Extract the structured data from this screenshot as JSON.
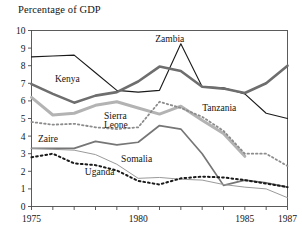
{
  "chart_data": {
    "type": "line",
    "title": "Percentage of GDP",
    "xlabel": "",
    "ylabel": "",
    "xlim": [
      1975,
      1987
    ],
    "ylim": [
      0,
      10
    ],
    "grid": false,
    "legend_position": "inline-annotations",
    "x_ticks": [
      1975,
      1976,
      1977,
      1978,
      1979,
      1980,
      1981,
      1982,
      1983,
      1984,
      1985,
      1986,
      1987
    ],
    "x_tick_labels": [
      "1975",
      "",
      "",
      "",
      "",
      "1980",
      "",
      "",
      "",
      "",
      "1985",
      "",
      "1987"
    ],
    "y_ticks": [
      0,
      1,
      2,
      3,
      4,
      5,
      6,
      7,
      8,
      9,
      10
    ],
    "y_tick_labels": [
      "0",
      "1",
      "2",
      "3",
      "4",
      "5",
      "6",
      "7",
      "8",
      "9",
      "10"
    ],
    "x": [
      1975,
      1976,
      1977,
      1978,
      1979,
      1980,
      1981,
      1982,
      1983,
      1984,
      1985,
      1986,
      1987
    ],
    "series": [
      {
        "name": "Zambia",
        "color": "#1a1a1a",
        "width": 1.1,
        "dash": "solid",
        "values": [
          8.5,
          8.55,
          8.6,
          7.6,
          6.6,
          6.5,
          6.6,
          9.25,
          6.8,
          6.75,
          6.4,
          5.3,
          5.0
        ]
      },
      {
        "name": "Kenya",
        "color": "#6e6e6e",
        "width": 2.6,
        "dash": "solid",
        "values": [
          6.95,
          6.4,
          5.9,
          6.3,
          6.5,
          7.1,
          7.95,
          7.7,
          6.8,
          6.7,
          6.45,
          7.0,
          8.0
        ]
      },
      {
        "name": "Tanzania",
        "color": "#b3b3b3",
        "width": 3.0,
        "dash": "solid",
        "values": [
          6.2,
          5.2,
          5.3,
          5.75,
          5.95,
          5.6,
          5.25,
          5.7,
          4.9,
          4.15,
          2.85,
          null,
          null
        ]
      },
      {
        "name": "Sierra Leone",
        "color": "#8c8c8c",
        "width": 1.8,
        "dash": "dotted",
        "values": [
          4.8,
          4.65,
          4.7,
          4.5,
          4.4,
          4.5,
          5.95,
          5.6,
          5.1,
          4.3,
          3.0,
          3.0,
          2.3
        ]
      },
      {
        "name": "Zaire",
        "color": "#767676",
        "width": 1.7,
        "dash": "solid",
        "values": [
          3.3,
          3.3,
          3.3,
          3.7,
          3.5,
          3.65,
          4.6,
          4.4,
          3.0,
          1.2,
          1.5,
          1.35,
          1.1
        ]
      },
      {
        "name": "Somalia",
        "color": "#9a9a9a",
        "width": 1.0,
        "dash": "solid",
        "values": [
          3.3,
          3.25,
          3.2,
          2.95,
          2.4,
          1.6,
          1.65,
          1.55,
          1.5,
          1.25,
          1.1,
          1.0,
          0.5
        ]
      },
      {
        "name": "Uganda",
        "color": "#1a1a1a",
        "width": 2.0,
        "dash": "dotted",
        "values": [
          2.8,
          3.0,
          2.45,
          2.35,
          2.05,
          1.45,
          1.25,
          1.6,
          1.7,
          1.65,
          1.5,
          1.3,
          1.1
        ]
      }
    ],
    "annotations": [
      {
        "text": "Kenya",
        "x": 1976.1,
        "y": 7.05
      },
      {
        "text": "Zambia",
        "x": 1980.8,
        "y": 9.35
      },
      {
        "text": "Tanzania",
        "x": 1983.0,
        "y": 5.45
      },
      {
        "text": "Sierra",
        "x": 1978.4,
        "y": 5.0
      },
      {
        "text": "Leone",
        "x": 1978.4,
        "y": 4.45
      },
      {
        "text": "Zaire",
        "x": 1975.3,
        "y": 3.65
      },
      {
        "text": "Somalia",
        "x": 1979.2,
        "y": 2.55
      },
      {
        "text": "Uganda",
        "x": 1977.5,
        "y": 1.78
      }
    ]
  }
}
